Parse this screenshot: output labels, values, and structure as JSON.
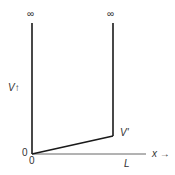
{
  "diagram": {
    "type": "potential-well",
    "labels": {
      "infinity_left": "∞",
      "infinity_right": "∞",
      "v_axis": "V↑",
      "v_prime": "V'",
      "origin_y": "0",
      "origin_x": "0",
      "x_axis": "x →",
      "length": "L"
    },
    "colors": {
      "line": "#1a1a1a",
      "axis": "#555555",
      "text": "#333333"
    }
  }
}
